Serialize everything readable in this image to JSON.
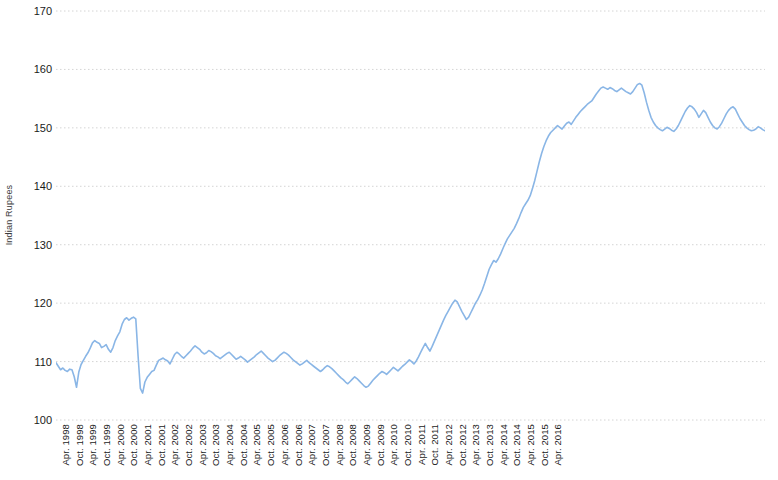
{
  "chart_data": {
    "type": "line",
    "title": "",
    "xlabel": "",
    "ylabel": "Indian Rupees",
    "ylim": [
      100,
      170
    ],
    "ytick_values": [
      100,
      110,
      120,
      130,
      140,
      150,
      160,
      170
    ],
    "ytick_labels": [
      "100",
      "110",
      "120",
      "130",
      "140",
      "150",
      "160",
      "170"
    ],
    "grid": true,
    "grid_axis": "y",
    "grid_style": "dotted",
    "legend": false,
    "line_color": "#8ab6e6",
    "line_width": 1.6,
    "x_tick_labels": [
      "Apr. 1998",
      "Oct. 1998",
      "Apr. 1999",
      "Oct. 1999",
      "Apr. 2000",
      "Oct. 2000",
      "Apr. 2001",
      "Oct. 2001",
      "Apr. 2002",
      "Oct. 2002",
      "Apr. 2003",
      "Oct. 2003",
      "Apr. 2004",
      "Oct. 2004",
      "Apr. 2005",
      "Oct. 2005",
      "Apr. 2006",
      "Oct. 2006",
      "Apr. 2007",
      "Oct. 2007",
      "Apr. 2008",
      "Oct. 2008",
      "Apr. 2009",
      "Oct. 2009",
      "Apr. 2010",
      "Oct. 2010",
      "Apr. 2011",
      "Oct. 2011",
      "Apr. 2012",
      "Oct. 2012",
      "Apr. 2013",
      "Oct. 2013",
      "Apr. 2014",
      "Oct. 2014",
      "Apr. 2015",
      "Oct. 2015",
      "Apr. 2016"
    ],
    "x_start": "Apr. 1998",
    "x_end": "Apr. 2016",
    "x_interval": "monthly",
    "series": [
      {
        "name": "Indian Rupees",
        "color": "#8ab6e6",
        "values": [
          109.8,
          109.2,
          108.6,
          108.9,
          108.5,
          108.3,
          108.7,
          108.6,
          107.4,
          105.6,
          108.2,
          109.5,
          110.2,
          110.9,
          111.5,
          112.3,
          113.2,
          113.6,
          113.3,
          113.1,
          112.4,
          112.6,
          112.9,
          112.1,
          111.6,
          112.4,
          113.6,
          114.4,
          115.1,
          116.4,
          117.2,
          117.5,
          117.1,
          117.4,
          117.6,
          117.3,
          111.0,
          105.4,
          104.6,
          106.5,
          107.3,
          107.8,
          108.3,
          108.5,
          109.4,
          110.2,
          110.4,
          110.6,
          110.3,
          110.1,
          109.6,
          110.4,
          111.2,
          111.6,
          111.3,
          110.9,
          110.6,
          111.0,
          111.4,
          111.8,
          112.3,
          112.7,
          112.4,
          112.1,
          111.6,
          111.3,
          111.5,
          111.9,
          111.7,
          111.4,
          111.0,
          110.8,
          110.5,
          110.8,
          111.1,
          111.4,
          111.6,
          111.2,
          110.8,
          110.4,
          110.6,
          110.9,
          110.6,
          110.3,
          109.9,
          110.2,
          110.5,
          110.8,
          111.2,
          111.5,
          111.8,
          111.4,
          111.0,
          110.6,
          110.3,
          110.0,
          110.2,
          110.6,
          111.0,
          111.3,
          111.6,
          111.4,
          111.1,
          110.7,
          110.3,
          110.0,
          109.7,
          109.4,
          109.6,
          109.9,
          110.2,
          109.8,
          109.5,
          109.2,
          108.9,
          108.6,
          108.3,
          108.6,
          109.0,
          109.3,
          109.1,
          108.8,
          108.4,
          108.0,
          107.6,
          107.2,
          106.9,
          106.5,
          106.2,
          106.6,
          107.0,
          107.4,
          107.1,
          106.7,
          106.3,
          105.9,
          105.6,
          105.8,
          106.3,
          106.8,
          107.2,
          107.6,
          108.0,
          108.3,
          108.1,
          107.8,
          108.2,
          108.6,
          109.0,
          108.7,
          108.4,
          108.8,
          109.2,
          109.5,
          109.9,
          110.3,
          110.0,
          109.6,
          110.1,
          110.8,
          111.6,
          112.4,
          113.1,
          112.4,
          111.8,
          112.6,
          113.5,
          114.4,
          115.3,
          116.2,
          117.1,
          117.9,
          118.6,
          119.3,
          120.0,
          120.5,
          120.2,
          119.4,
          118.6,
          117.9,
          117.2,
          117.6,
          118.4,
          119.2,
          120.0,
          120.6,
          121.4,
          122.3,
          123.4,
          124.6,
          125.8,
          126.6,
          127.3,
          127.0,
          127.6,
          128.4,
          129.3,
          130.2,
          131.0,
          131.6,
          132.2,
          132.8,
          133.6,
          134.5,
          135.5,
          136.4,
          137.0,
          137.6,
          138.4,
          139.6,
          141.0,
          142.6,
          144.2,
          145.6,
          146.8,
          147.8,
          148.6,
          149.2,
          149.6,
          150.0,
          150.4,
          150.1,
          149.8,
          150.3,
          150.8,
          151.0,
          150.6,
          151.2,
          151.8,
          152.3,
          152.8,
          153.2,
          153.6,
          154.0,
          154.3,
          154.6,
          155.2,
          155.8,
          156.3,
          156.8,
          157.0,
          156.8,
          156.6,
          156.9,
          156.7,
          156.4,
          156.2,
          156.5,
          156.8,
          156.5,
          156.2,
          156.0,
          155.8,
          156.2,
          156.8,
          157.4,
          157.6,
          157.3,
          156.0,
          154.4,
          153.0,
          151.8,
          151.0,
          150.4,
          150.0,
          149.7,
          149.5,
          149.8,
          150.1,
          149.9,
          149.6,
          149.4,
          149.8,
          150.4,
          151.2,
          152.0,
          152.8,
          153.4,
          153.8,
          153.6,
          153.2,
          152.6,
          151.8,
          152.4,
          153.0,
          152.6,
          151.8,
          151.0,
          150.4,
          150.0,
          149.8,
          150.2,
          150.8,
          151.6,
          152.4,
          153.0,
          153.4,
          153.6,
          153.2,
          152.4,
          151.6,
          151.0,
          150.4,
          150.0,
          149.7,
          149.5,
          149.6,
          149.8,
          150.2,
          150.0,
          149.7,
          149.5
        ]
      }
    ]
  }
}
